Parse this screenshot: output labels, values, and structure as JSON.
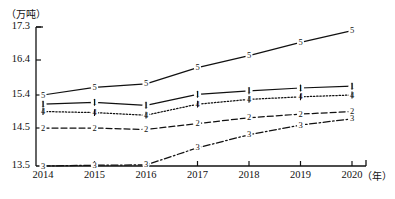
{
  "chart_data": {
    "type": "line",
    "title": "",
    "xlabel": "（年）",
    "ylabel": "（万吨）",
    "ylim": [
      13.5,
      17.3
    ],
    "grid": false,
    "legend": "none",
    "marker_style": "numbered",
    "categories": [
      "2014",
      "2015",
      "2016",
      "2017",
      "2018",
      "2019",
      "2020"
    ],
    "y_ticks": [
      "13.5",
      "14.5",
      "15.4",
      "16.4",
      "17.3"
    ],
    "y_tick_values": [
      13.5,
      14.5,
      15.4,
      16.4,
      17.3
    ],
    "series": [
      {
        "name": "1",
        "marker": "1",
        "line_style": "solid",
        "values": [
          15.15,
          15.2,
          15.12,
          15.42,
          15.52,
          15.6,
          15.65
        ]
      },
      {
        "name": "2",
        "marker": "2",
        "line_style": "dashed",
        "values": [
          14.5,
          14.5,
          14.46,
          14.62,
          14.78,
          14.88,
          14.95
        ]
      },
      {
        "name": "3",
        "marker": "3",
        "line_style": "dashdot",
        "values": [
          13.5,
          13.52,
          13.53,
          13.98,
          14.32,
          14.58,
          14.75
        ]
      },
      {
        "name": "4",
        "marker": "4",
        "line_style": "dotted",
        "values": [
          14.95,
          14.92,
          14.85,
          15.15,
          15.28,
          15.35,
          15.4
        ]
      },
      {
        "name": "5",
        "marker": "5",
        "line_style": "solid",
        "values": [
          15.4,
          15.62,
          15.72,
          16.18,
          16.52,
          16.88,
          17.2
        ]
      }
    ]
  }
}
